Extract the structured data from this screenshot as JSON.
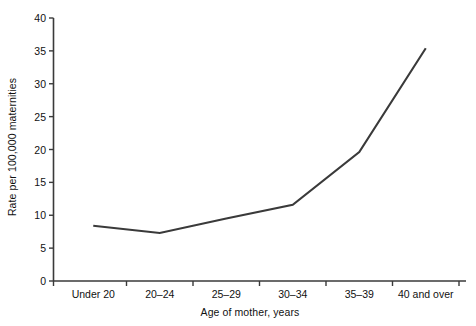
{
  "chart_data": {
    "type": "line",
    "title": "",
    "xlabel": "Age of mother, years",
    "ylabel": "Rate per 100,000 maternities",
    "categories": [
      "Under 20",
      "20–24",
      "25–29",
      "30–34",
      "35–39",
      "40 and over"
    ],
    "series": [
      {
        "name": "Rate per 100,000 maternities",
        "values": [
          8.4,
          7.3,
          9.5,
          11.6,
          19.6,
          35.4
        ],
        "color": "#3a3a3a"
      }
    ],
    "ylim": [
      0,
      40
    ],
    "yticks": [
      0,
      5,
      10,
      15,
      20,
      25,
      30,
      35,
      40
    ],
    "ytick_labels": [
      "0",
      "5",
      "10",
      "15",
      "20",
      "25",
      "30",
      "35",
      "40"
    ],
    "grid": false,
    "legend": false,
    "legend_position": "none",
    "axis_color": "#3a3a3a",
    "background": "#ffffff"
  }
}
